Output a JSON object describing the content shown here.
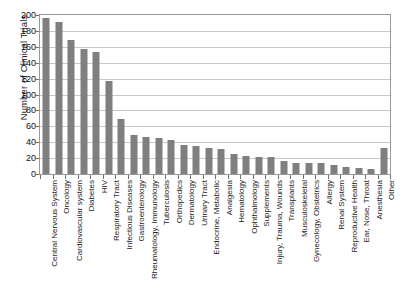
{
  "chart_data": {
    "type": "bar",
    "title": "",
    "xlabel": "",
    "ylabel": "Number of Clinical Trials",
    "ylim": [
      0,
      200
    ],
    "ytick_step": 20,
    "yticks": [
      200,
      180,
      160,
      140,
      120,
      100,
      80,
      60,
      40,
      20,
      0
    ],
    "grid": true,
    "legend": "none",
    "bar_color": "#7f7f7f",
    "categories": [
      "Central Nervous System",
      "Oncology",
      "Cardiovascular system",
      "Diabetes",
      "HIV",
      "Respiratory Tract",
      "Infectious Diseases",
      "Gastroenterology",
      "Rheumatology, Immunology",
      "Tuberculosis",
      "Orthopedics",
      "Dermatology",
      "Urinary Tract",
      "Endocrine, Metabolic",
      "Analgesia",
      "Hematology",
      "Ophthalmology",
      "Supplements",
      "Injury, Trauma, Wounds",
      "Transplants",
      "Musculoskeletal",
      "Gynecology, Obstetrics",
      "Allergy",
      "Renal System",
      "Reproductive Health",
      "Ear, Nose, Throat",
      "Anesthesia",
      "Other"
    ],
    "values": [
      196,
      191,
      168,
      157,
      154,
      117,
      69,
      49,
      46,
      45,
      43,
      36,
      35,
      33,
      32,
      25,
      23,
      22,
      22,
      17,
      14,
      14,
      14,
      11,
      9,
      8,
      6,
      33
    ]
  }
}
